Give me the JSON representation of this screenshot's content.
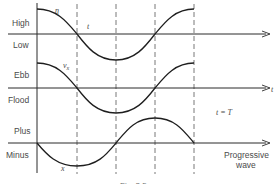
{
  "diagram": {
    "panels": [
      {
        "id": "elevation",
        "upper_label": "High",
        "lower_label": "Low",
        "curve_label": "η",
        "axis_label": "t"
      },
      {
        "id": "current",
        "upper_label": "Ebb",
        "lower_label": "Flood",
        "curve_label": "v",
        "curve_label_sub": "x",
        "axis_label": "t"
      },
      {
        "id": "progressive",
        "upper_label": "Plus",
        "lower_label": "Minus",
        "curve_label": "x",
        "axis_label_line1": "Progressive",
        "axis_label_line2": "wave"
      }
    ],
    "annotation": "t = T",
    "caption": "Fig. 2.5",
    "colors": {
      "line": "#2a2a2a",
      "dashed": "#555555",
      "text": "#4a4a4a"
    }
  }
}
